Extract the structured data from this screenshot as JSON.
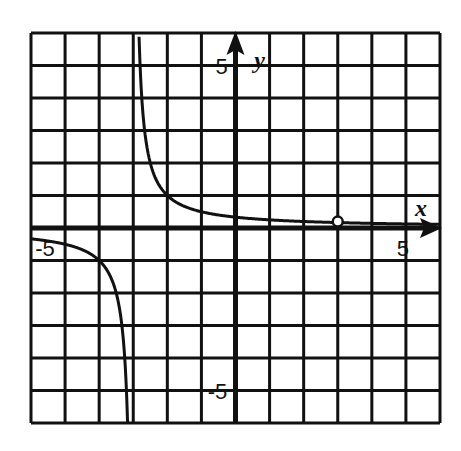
{
  "chart_data": {
    "type": "line",
    "title": "",
    "xlabel": "x",
    "ylabel": "y",
    "xlim": [
      -6,
      6
    ],
    "ylim": [
      -6,
      6
    ],
    "grid": true,
    "grid_step": 1,
    "tick_labels": [
      {
        "axis": "x",
        "value": -5,
        "text": "-5"
      },
      {
        "axis": "x",
        "value": 5,
        "text": "5"
      },
      {
        "axis": "y",
        "value": 5,
        "text": "5"
      },
      {
        "axis": "y",
        "value": -5,
        "text": "-5"
      }
    ],
    "series": [
      {
        "name": "y = 1/(x+3)",
        "function": "1/(x+3)",
        "vertical_asymptote": -3,
        "horizontal_asymptote": 0,
        "branches": [
          {
            "x_from": -6,
            "x_to": -3.16
          },
          {
            "x_from": -2.83,
            "x_to": 6
          }
        ],
        "sample_points": [
          {
            "x": -6,
            "y": -0.333
          },
          {
            "x": -5,
            "y": -0.5
          },
          {
            "x": -4,
            "y": -1
          },
          {
            "x": -3.5,
            "y": -2
          },
          {
            "x": -3.25,
            "y": -4
          },
          {
            "x": -2.75,
            "y": 4
          },
          {
            "x": -2.5,
            "y": 2
          },
          {
            "x": -2,
            "y": 1
          },
          {
            "x": -1,
            "y": 0.5
          },
          {
            "x": 0,
            "y": 0.333
          },
          {
            "x": 1,
            "y": 0.25
          },
          {
            "x": 2,
            "y": 0.2
          },
          {
            "x": 4,
            "y": 0.143
          },
          {
            "x": 5,
            "y": 0.125
          }
        ],
        "open_points": [
          {
            "x": 3,
            "y": 0.167
          }
        ]
      }
    ]
  }
}
